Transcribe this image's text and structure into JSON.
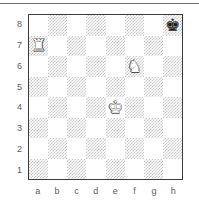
{
  "figure": {
    "kind": "chess-board-diagram",
    "rule_above": true
  },
  "board": {
    "files": [
      "a",
      "b",
      "c",
      "d",
      "e",
      "f",
      "g",
      "h"
    ],
    "ranks": [
      "8",
      "7",
      "6",
      "5",
      "4",
      "3",
      "2",
      "1"
    ],
    "orientation": "white-bottom",
    "light_square_color": "#ffffff",
    "dark_square_color": "#c9c9c9",
    "border_color": "#3a3a3a",
    "label_color": "#5d5d5d",
    "pieces": [
      {
        "square": "a7",
        "file": "a",
        "rank": "7",
        "color": "white",
        "type": "rook",
        "glyph": "♜",
        "name": "white-rook-a7"
      },
      {
        "square": "f6",
        "file": "f",
        "rank": "6",
        "color": "white",
        "type": "knight",
        "glyph": "♞",
        "name": "white-knight-f6"
      },
      {
        "square": "e4",
        "file": "e",
        "rank": "4",
        "color": "white",
        "type": "king",
        "glyph": "♚",
        "name": "white-king-e4"
      },
      {
        "square": "h8",
        "file": "h",
        "rank": "8",
        "color": "black",
        "type": "king",
        "glyph": "♚",
        "name": "black-king-h8"
      }
    ]
  },
  "labels": {
    "rank_8": "8",
    "rank_7": "7",
    "rank_6": "6",
    "rank_5": "5",
    "rank_4": "4",
    "rank_3": "3",
    "rank_2": "2",
    "rank_1": "1",
    "file_a": "a",
    "file_b": "b",
    "file_c": "c",
    "file_d": "d",
    "file_e": "e",
    "file_f": "f",
    "file_g": "g",
    "file_h": "h"
  }
}
